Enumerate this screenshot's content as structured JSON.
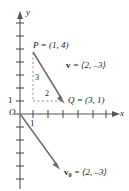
{
  "figure": {
    "type": "coordinate-plane-vector-diagram",
    "axes": {
      "x_label": "x",
      "y_label": "y",
      "origin_label": "O",
      "x_tick_label": "1",
      "y_tick_label": "1"
    },
    "points": {
      "P": {
        "label": "P = (1, 4)",
        "coords": [
          1,
          4
        ]
      },
      "Q": {
        "label": "Q = (3, 1)",
        "coords": [
          3,
          1
        ]
      }
    },
    "vectors": {
      "v": {
        "label_name": "v",
        "label_rest": " = ⟨2, –3⟩",
        "components": [
          2,
          -3
        ]
      },
      "v0": {
        "label_name": "v",
        "label_sub": "0",
        "label_rest": " = ⟨2, –3⟩",
        "components": [
          2,
          -3
        ]
      }
    },
    "legs": {
      "vertical": "3",
      "horizontal": "2"
    },
    "colors": {
      "axis": "#555555",
      "vector": "#6b6b6b",
      "dashed": "#8a8a8a",
      "text": "#1a1a1a"
    }
  }
}
